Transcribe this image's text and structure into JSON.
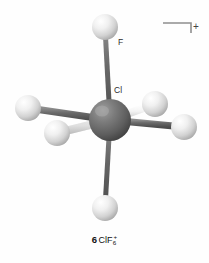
{
  "figure": {
    "name": "octahedral-molecule-diagram",
    "background_color": "#fefefe",
    "charge_bracket": {
      "symbol": "+",
      "name": "charge-bracket",
      "color": "#8a8a8a"
    },
    "labels": {
      "fluorine": "F",
      "chlorine": "Cl",
      "label_color": "#2b2b2b"
    },
    "caption": {
      "index": "6",
      "formula_base": "ClF",
      "formula_subscript": "6",
      "formula_superscript": "+"
    },
    "colors": {
      "central_atom": "#6e6e6e",
      "central_atom_dark": "#4a4a4a",
      "central_atom_highlight": "#9a9a9a",
      "ligand_atom": "#e6e6e6",
      "ligand_atom_dark": "#a8a8a8",
      "ligand_atom_highlight": "#fdfdfd",
      "bond_light": "#f2f2f2",
      "bond_dark": "#6a6a6a"
    },
    "atoms": [
      {
        "name": "chlorine-center",
        "element": "Cl",
        "cx": 110,
        "cy": 120,
        "r": 21,
        "kind": "central"
      },
      {
        "name": "fluorine-top",
        "element": "F",
        "cx": 105,
        "cy": 27,
        "r": 13,
        "kind": "ligand"
      },
      {
        "name": "fluorine-bottom",
        "element": "F",
        "cx": 105,
        "cy": 208,
        "r": 13,
        "kind": "ligand"
      },
      {
        "name": "fluorine-upper-left",
        "element": "F",
        "cx": 28,
        "cy": 108,
        "r": 13,
        "kind": "ligand"
      },
      {
        "name": "fluorine-lower-left",
        "element": "F",
        "cx": 57,
        "cy": 133,
        "r": 13,
        "kind": "ligand"
      },
      {
        "name": "fluorine-upper-right",
        "element": "F",
        "cx": 155,
        "cy": 104,
        "r": 13,
        "kind": "ligand"
      },
      {
        "name": "fluorine-right",
        "element": "F",
        "cx": 184,
        "cy": 127,
        "r": 13,
        "kind": "ligand"
      }
    ],
    "bonds": [
      {
        "name": "bond-top",
        "x1": 110,
        "y1": 120,
        "x2": 105,
        "y2": 27,
        "width": 5,
        "style": "dark"
      },
      {
        "name": "bond-bottom",
        "x1": 110,
        "y1": 120,
        "x2": 105,
        "y2": 208,
        "width": 5,
        "style": "dark"
      },
      {
        "name": "bond-upper-left",
        "x1": 110,
        "y1": 120,
        "x2": 28,
        "y2": 108,
        "width": 7,
        "style": "dark"
      },
      {
        "name": "bond-lower-left",
        "x1": 110,
        "y1": 120,
        "x2": 57,
        "y2": 133,
        "width": 7,
        "style": "light"
      },
      {
        "name": "bond-upper-right",
        "x1": 110,
        "y1": 120,
        "x2": 155,
        "y2": 104,
        "width": 7,
        "style": "light"
      },
      {
        "name": "bond-right",
        "x1": 110,
        "y1": 120,
        "x2": 184,
        "y2": 127,
        "width": 7,
        "style": "dark"
      }
    ]
  }
}
